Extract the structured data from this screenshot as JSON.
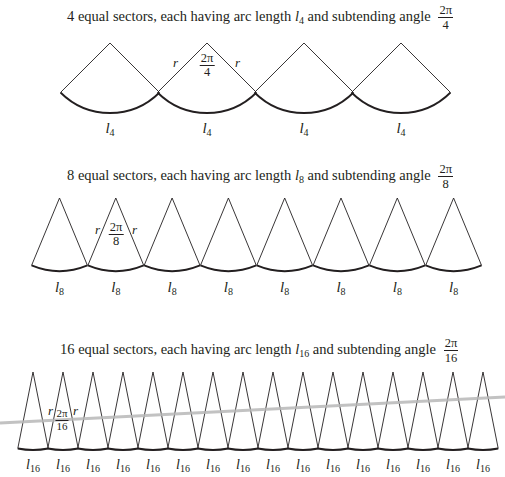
{
  "rows": [
    {
      "caption_prefix": "4 equal sectors, each having arc length",
      "arc_symbol": "l",
      "subscript": "4",
      "caption_middle": "and subtending angle",
      "angle_num": "2π",
      "angle_den": "4",
      "sector_count": 4,
      "sector_label": "l",
      "radius_label": "r"
    },
    {
      "caption_prefix": "8 equal sectors, each having arc length",
      "arc_symbol": "l",
      "subscript": "8",
      "caption_middle": "and subtending angle",
      "angle_num": "2π",
      "angle_den": "8",
      "sector_count": 8,
      "sector_label": "l",
      "radius_label": "r"
    },
    {
      "caption_prefix": "16 equal sectors, each having arc length",
      "arc_symbol": "l",
      "subscript": "16",
      "caption_middle": "and subtending angle",
      "angle_num": "2π",
      "angle_den": "16",
      "sector_count": 16,
      "sector_label": "l",
      "radius_label": "r"
    }
  ],
  "colors": {
    "stroke": "#231f20",
    "arc": "#231f20",
    "artifact_line": "#b5b5b5"
  }
}
